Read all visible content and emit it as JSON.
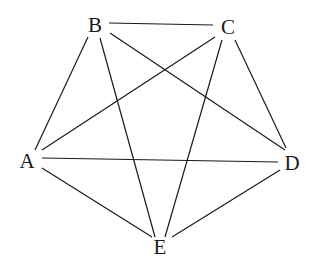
{
  "diagram": {
    "type": "complete-graph",
    "name": "K5",
    "colors": {
      "edge": "#1a1a1a",
      "label": "#1a1a1a",
      "background": "#ffffff"
    },
    "nodes": [
      {
        "id": "A",
        "label": "A",
        "x": 27,
        "y": 168
      },
      {
        "id": "B",
        "label": "B",
        "x": 95,
        "y": 32
      },
      {
        "id": "C",
        "label": "C",
        "x": 228,
        "y": 34
      },
      {
        "id": "D",
        "label": "D",
        "x": 292,
        "y": 170
      },
      {
        "id": "E",
        "label": "E",
        "x": 160,
        "y": 254
      }
    ],
    "edges": [
      {
        "from": "B",
        "to": "C",
        "x1": 109,
        "y1": 23,
        "x2": 213,
        "y2": 25
      },
      {
        "from": "B",
        "to": "A",
        "x1": 88,
        "y1": 37,
        "x2": 35,
        "y2": 150
      },
      {
        "from": "B",
        "to": "E",
        "x1": 100,
        "y1": 38,
        "x2": 155,
        "y2": 237
      },
      {
        "from": "B",
        "to": "D",
        "x1": 110,
        "y1": 33,
        "x2": 285,
        "y2": 150
      },
      {
        "from": "C",
        "to": "A",
        "x1": 215,
        "y1": 37,
        "x2": 42,
        "y2": 150
      },
      {
        "from": "C",
        "to": "E",
        "x1": 222,
        "y1": 40,
        "x2": 165,
        "y2": 237
      },
      {
        "from": "C",
        "to": "D",
        "x1": 235,
        "y1": 40,
        "x2": 286,
        "y2": 148
      },
      {
        "from": "A",
        "to": "D",
        "x1": 42,
        "y1": 158,
        "x2": 278,
        "y2": 162
      },
      {
        "from": "A",
        "to": "E",
        "x1": 42,
        "y1": 168,
        "x2": 152,
        "y2": 237
      },
      {
        "from": "D",
        "to": "E",
        "x1": 280,
        "y1": 170,
        "x2": 172,
        "y2": 237
      }
    ]
  }
}
